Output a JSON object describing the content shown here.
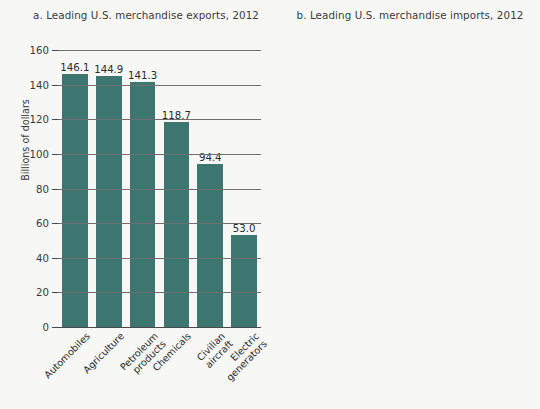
{
  "figure": {
    "background_color": "#f7f7f5",
    "panels": [
      {
        "id": "panel-a",
        "title": "a. Leading U.S. merchandise exports, 2012",
        "ylabel": "Billions of dollars",
        "bar_color": "#3d7570"
      },
      {
        "id": "panel-b",
        "title": "b. Leading U.S. merchandise imports, 2012",
        "ylabel": "Billions of dollars",
        "bar_color": "#c4652a"
      }
    ]
  },
  "chart_data": [
    {
      "type": "bar",
      "title": "a. Leading U.S. merchandise exports, 2012",
      "xlabel": "",
      "ylabel": "Billions of dollars",
      "ylim": [
        0,
        160
      ],
      "ytick_step": 20,
      "yticks": [
        0,
        20,
        40,
        60,
        80,
        100,
        120,
        140,
        160
      ],
      "ytick_labels": [
        "0",
        "20",
        "40",
        "60",
        "80",
        "100",
        "120",
        "140",
        "160"
      ],
      "grid": true,
      "legend": "none",
      "bar_color": "#3d7570",
      "categories": [
        "Automobiles",
        "Petroleum products",
        "Agriculture",
        "Chemicals",
        "Civilian aircraft",
        "Electric generators"
      ],
      "category_lines": [
        [
          "Automobiles"
        ],
        [
          "Agriculture"
        ],
        [
          "Petroleum",
          "products"
        ],
        [
          "Chemicals"
        ],
        [
          "Civilian",
          "aircraft"
        ],
        [
          "Electric",
          "generators"
        ]
      ],
      "category_order": [
        "Automobiles",
        "Agriculture",
        "Petroleum products",
        "Chemicals",
        "Civilian aircraft",
        "Electric generators"
      ],
      "values": [
        146.1,
        144.9,
        141.3,
        118.7,
        94.4,
        53.0
      ],
      "value_labels": [
        "146.1",
        "144.9",
        "141.3",
        "118.7",
        "94.4",
        "53.0"
      ]
    },
    {
      "type": "bar",
      "title": "b. Leading U.S. merchandise imports, 2012",
      "xlabel": "",
      "ylabel": "Billions of dollars",
      "ylim": [
        0,
        500
      ],
      "ytick_step": 50,
      "yticks": [
        0,
        50,
        100,
        150,
        200,
        250,
        300,
        350,
        400,
        450,
        500
      ],
      "ytick_labels": [
        "0",
        "50",
        "100",
        "150",
        "200",
        "250",
        "300",
        "350",
        "400",
        "450",
        "500"
      ],
      "grid": true,
      "legend": "none",
      "bar_color": "#c4652a",
      "categories": [
        "Petroleum products",
        "Automobiles",
        "Household goods",
        "Apparel and footwear",
        "Computers",
        "Agriculture"
      ],
      "category_lines": [
        [
          "Petroleum",
          "products"
        ],
        [
          "Automobiles"
        ],
        [
          "Household",
          "goods"
        ],
        [
          "Apparel and",
          "footwear"
        ],
        [
          "Computers"
        ],
        [
          "Agriculture"
        ]
      ],
      "category_order": [
        "Petroleum products",
        "Automobiles",
        "Household goods",
        "Apparel and footwear",
        "Computers",
        "Agriculture"
      ],
      "values": [
        433.9,
        298.5,
        141.3,
        126.9,
        122.2,
        103.0
      ],
      "value_labels": [
        "433.9",
        "298.5",
        "141.3",
        "126.9",
        "122.2",
        "103.0"
      ]
    }
  ]
}
